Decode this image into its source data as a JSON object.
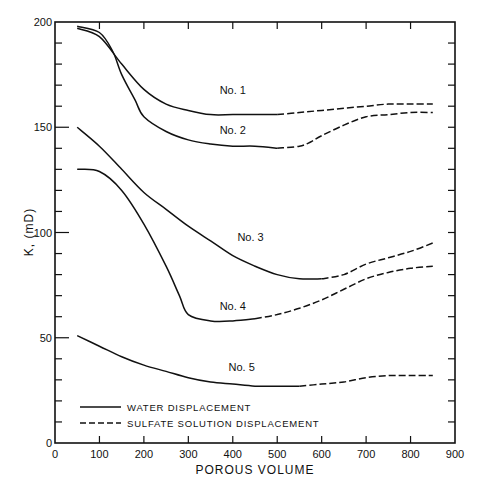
{
  "chart_data": {
    "type": "line",
    "title": "",
    "xlabel": "POROUS VOLUME",
    "ylabel": "K, (mD)",
    "xlim": [
      0,
      900
    ],
    "ylim": [
      0,
      200
    ],
    "xticks": [
      0,
      100,
      200,
      300,
      400,
      500,
      600,
      700,
      800,
      900
    ],
    "yticks_labeled": [
      0,
      50,
      100,
      150,
      200
    ],
    "y_minor_step": 10,
    "grid": false,
    "legend": {
      "position": "lower-left-inside",
      "entries": [
        {
          "label": "WATER DISPLACEMENT",
          "style": "solid"
        },
        {
          "label": "SULFATE SOLUTION DISPLACEMENT",
          "style": "dashed"
        }
      ]
    },
    "series": [
      {
        "name": "No. 1",
        "label_at": [
          400,
          166
        ],
        "water": {
          "x": [
            50,
            100,
            150,
            200,
            250,
            300,
            350,
            400,
            450,
            500
          ],
          "y": [
            197,
            193,
            180,
            168,
            161,
            158,
            156,
            156,
            156,
            156
          ]
        },
        "sulfate": {
          "x": [
            500,
            550,
            600,
            650,
            700,
            750,
            800,
            850
          ],
          "y": [
            156,
            157,
            158,
            159,
            160,
            161,
            161,
            161
          ]
        }
      },
      {
        "name": "No. 2",
        "label_at": [
          400,
          147
        ],
        "water": {
          "x": [
            50,
            100,
            130,
            150,
            180,
            200,
            250,
            300,
            350,
            400,
            450,
            500
          ],
          "y": [
            198,
            195,
            186,
            175,
            163,
            155,
            148,
            144,
            142,
            141,
            141,
            140
          ]
        },
        "sulfate": {
          "x": [
            500,
            550,
            575,
            600,
            650,
            700,
            750,
            800,
            850
          ],
          "y": [
            140,
            141,
            143,
            146,
            151,
            155,
            156,
            157,
            157
          ]
        }
      },
      {
        "name": "No. 3",
        "label_at": [
          440,
          96
        ],
        "water": {
          "x": [
            50,
            100,
            150,
            200,
            250,
            300,
            350,
            400,
            450,
            500,
            550,
            600
          ],
          "y": [
            150,
            141,
            130,
            119,
            111,
            103,
            96,
            89,
            84,
            80,
            78,
            78
          ]
        },
        "sulfate": {
          "x": [
            600,
            650,
            700,
            750,
            800,
            850
          ],
          "y": [
            78,
            80,
            85,
            88,
            91,
            95
          ]
        }
      },
      {
        "name": "No. 4",
        "label_at": [
          400,
          63
        ],
        "water": {
          "x": [
            50,
            100,
            150,
            200,
            250,
            280,
            300,
            350,
            400,
            450
          ],
          "y": [
            130,
            129,
            120,
            104,
            84,
            70,
            61,
            58,
            58,
            59
          ]
        },
        "sulfate": {
          "x": [
            450,
            500,
            550,
            600,
            650,
            700,
            750,
            800,
            850
          ],
          "y": [
            59,
            61,
            64,
            68,
            73,
            78,
            81,
            83,
            84
          ]
        }
      },
      {
        "name": "No. 5",
        "label_at": [
          420,
          34
        ],
        "water": {
          "x": [
            50,
            100,
            150,
            200,
            250,
            300,
            350,
            400,
            450,
            500,
            550
          ],
          "y": [
            51,
            46,
            41,
            37,
            34,
            31,
            29,
            28,
            27,
            27,
            27
          ]
        },
        "sulfate": {
          "x": [
            550,
            600,
            650,
            700,
            750,
            800,
            850
          ],
          "y": [
            27,
            28,
            29,
            31,
            32,
            32,
            32
          ]
        }
      }
    ]
  }
}
